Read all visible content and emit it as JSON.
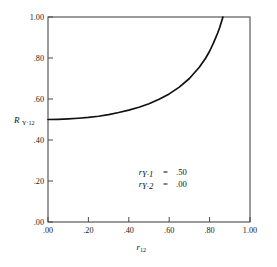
{
  "chart_data": {
    "type": "line",
    "title": "",
    "xlabel": "r12",
    "ylabel": "R Y·12",
    "xlim": [
      0.0,
      1.0
    ],
    "ylim": [
      0.0,
      1.0
    ],
    "grid": false,
    "legend": "none",
    "x_ticks": [
      ".00",
      ".20",
      ".40",
      ".60",
      ".80",
      "1.00"
    ],
    "y_ticks": [
      ".00",
      ".20",
      ".40",
      ".60",
      ".80",
      "1.00"
    ],
    "x_tick_values": [
      0.0,
      0.2,
      0.4,
      0.6,
      0.8,
      1.0
    ],
    "y_tick_values": [
      0.0,
      0.2,
      0.4,
      0.6,
      0.8,
      1.0
    ],
    "series": [
      {
        "name": "R Y·12",
        "x": [
          0.0,
          0.05,
          0.1,
          0.15,
          0.2,
          0.25,
          0.3,
          0.35,
          0.4,
          0.45,
          0.5,
          0.55,
          0.6,
          0.65,
          0.7,
          0.75,
          0.78,
          0.8,
          0.82,
          0.84,
          0.85,
          0.86,
          0.866
        ],
        "values": [
          0.5,
          0.501,
          0.503,
          0.506,
          0.51,
          0.516,
          0.524,
          0.534,
          0.546,
          0.56,
          0.577,
          0.599,
          0.625,
          0.658,
          0.7,
          0.756,
          0.799,
          0.833,
          0.875,
          0.922,
          0.949,
          0.98,
          1.0
        ]
      }
    ],
    "annotations": [
      {
        "symbol": "r",
        "subscript": "Y·1",
        "equals": "=",
        "value": ".50"
      },
      {
        "symbol": "r",
        "subscript": "Y·2",
        "equals": "=",
        "value": ".00"
      }
    ]
  },
  "axes": {
    "y_label_symbol": "R",
    "y_label_subscript": "Y·12",
    "x_label_symbol": "r",
    "x_label_subscript": "12"
  },
  "colors": {
    "curve": "#111111",
    "frame": "#4a4a4a",
    "background": "#ffffff",
    "text": "#111111"
  }
}
